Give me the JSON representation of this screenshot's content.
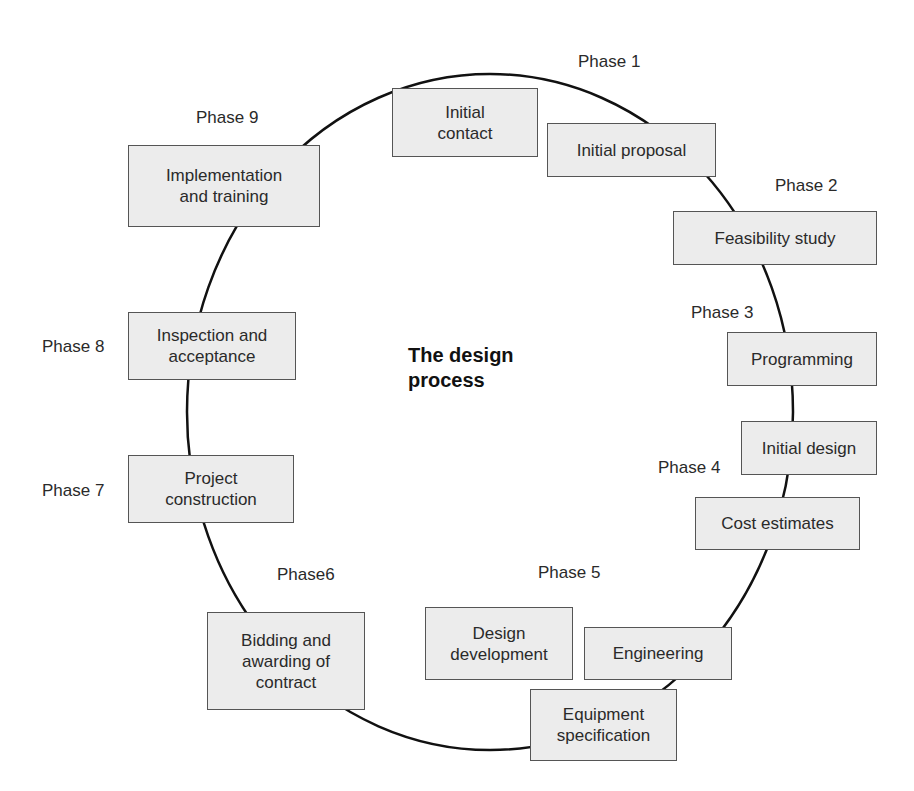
{
  "diagram": {
    "title": "The design\nprocess",
    "type": "cycle",
    "phases": [
      {
        "label": "Phase 1",
        "steps": [
          "Initial\ncontact",
          "Initial proposal"
        ]
      },
      {
        "label": "Phase 2",
        "steps": [
          "Feasibility study"
        ]
      },
      {
        "label": "Phase 3",
        "steps": [
          "Programming"
        ]
      },
      {
        "label": "Phase 4",
        "steps": [
          "Initial design",
          "Cost estimates"
        ]
      },
      {
        "label": "Phase 5",
        "steps": [
          "Design\ndevelopment",
          "Engineering",
          "Equipment\nspecification"
        ]
      },
      {
        "label": "Phase6",
        "steps": [
          "Bidding and\nawarding of\ncontract"
        ]
      },
      {
        "label": "Phase 7",
        "steps": [
          "Project\nconstruction"
        ]
      },
      {
        "label": "Phase 8",
        "steps": [
          "Inspection and\nacceptance"
        ]
      },
      {
        "label": "Phase 9",
        "steps": [
          "Implementation\nand training"
        ]
      }
    ]
  },
  "colors": {
    "box_fill": "#ececec",
    "box_border": "#555555",
    "line": "#111111",
    "text": "#2a2a2a"
  }
}
